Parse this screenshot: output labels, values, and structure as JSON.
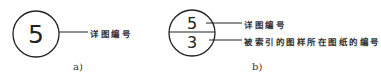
{
  "figure_a": {
    "number": "5",
    "label": "详图编号",
    "caption": "a)"
  },
  "figure_b": {
    "top_number": "5",
    "bottom_number": "3",
    "top_label": "详图编号",
    "bottom_label": "被索引的图样所在图纸的编号",
    "caption": "b)"
  }
}
